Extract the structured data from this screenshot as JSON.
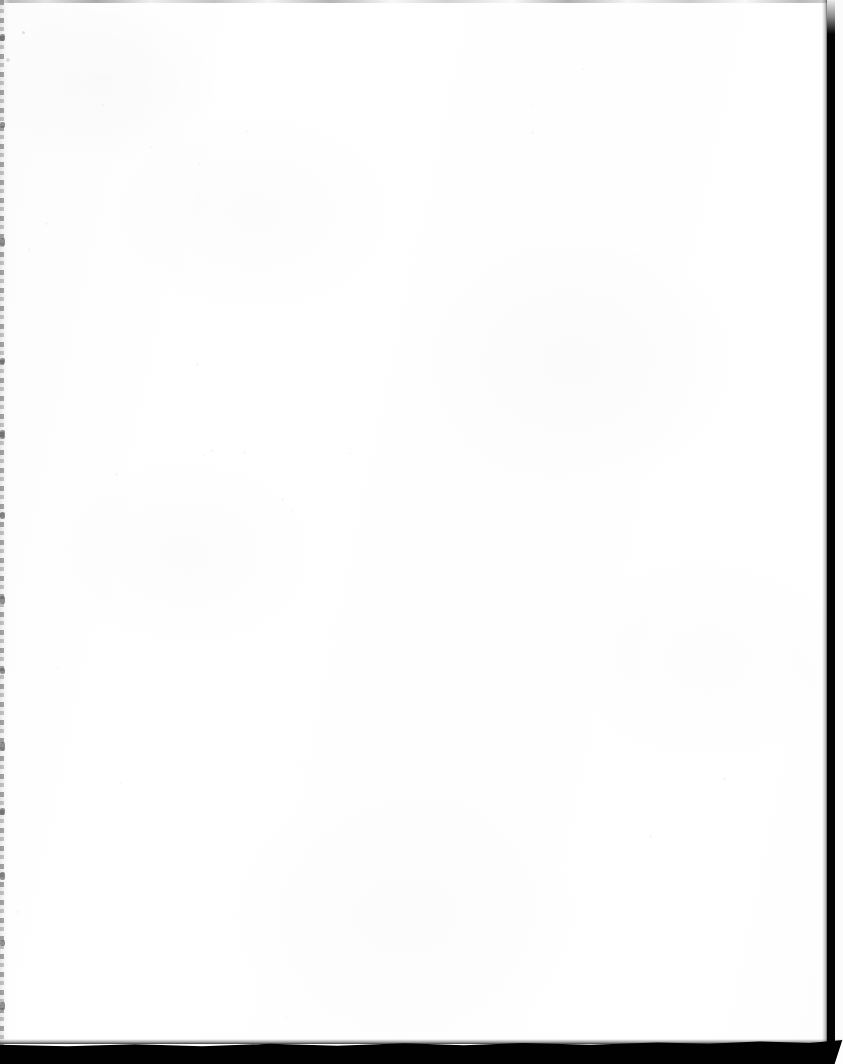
{
  "document": {
    "kind": "scanned-page",
    "page_state": "blank",
    "visible_text": "",
    "page_width_px": 843,
    "page_height_px": 1064
  },
  "page": {
    "body_text": "",
    "header_text": "",
    "footer_text": "",
    "page_number": "",
    "caption": ""
  },
  "colors": {
    "paper": "#fefefe",
    "paper_edge": "#fcfcfc",
    "scan_band_black": "#010101",
    "gutter_gray": "#6c6c70",
    "hairline_gray": "#84848a",
    "notch_white": "#fdfdfd"
  },
  "artifacts": {
    "top_hairline": {
      "name": "top-edge-hairline",
      "description": "",
      "y_px": 0,
      "height_px": 3,
      "color": "#84848a"
    },
    "left_gutter": {
      "name": "left-binding-gutter",
      "description": "",
      "x_px": 0,
      "width_px": 4,
      "color": "#6c6c70"
    },
    "right_band": {
      "name": "right-scanner-band",
      "description": "",
      "x_px": 827,
      "width_px": 8,
      "color": "#020202"
    },
    "bottom_band": {
      "name": "bottom-scanner-band",
      "description": "",
      "y_px": 1040,
      "height_px": 24,
      "color": "#010101"
    }
  },
  "gutter_blobs": [
    {
      "top": 34,
      "height": 7
    },
    {
      "top": 122,
      "height": 6
    },
    {
      "top": 238,
      "height": 8
    },
    {
      "top": 358,
      "height": 6
    },
    {
      "top": 430,
      "height": 9
    },
    {
      "top": 512,
      "height": 7
    },
    {
      "top": 596,
      "height": 8
    },
    {
      "top": 668,
      "height": 6
    },
    {
      "top": 742,
      "height": 9
    },
    {
      "top": 808,
      "height": 7
    },
    {
      "top": 872,
      "height": 8
    },
    {
      "top": 940,
      "height": 6
    },
    {
      "top": 1002,
      "height": 8
    }
  ],
  "specks": [
    {
      "left": 22,
      "top": 31,
      "size": 3,
      "tone": "dark"
    },
    {
      "left": 6,
      "top": 58,
      "size": 4,
      "tone": "dark"
    },
    {
      "left": 196,
      "top": 363,
      "size": 3,
      "tone": "faint"
    },
    {
      "left": 210,
      "top": 449,
      "size": 3,
      "tone": "faint"
    },
    {
      "left": 203,
      "top": 454,
      "size": 2,
      "tone": "faint"
    },
    {
      "left": 243,
      "top": 451,
      "size": 3,
      "tone": "faint"
    },
    {
      "left": 349,
      "top": 452,
      "size": 2,
      "tone": "faint"
    },
    {
      "left": 115,
      "top": 473,
      "size": 3,
      "tone": "faint"
    },
    {
      "left": 281,
      "top": 498,
      "size": 3,
      "tone": "faint"
    },
    {
      "left": 292,
      "top": 510,
      "size": 2,
      "tone": "faint"
    },
    {
      "left": 723,
      "top": 777,
      "size": 3,
      "tone": "faint"
    },
    {
      "left": 649,
      "top": 835,
      "size": 3,
      "tone": "faint"
    },
    {
      "left": 102,
      "top": 104,
      "size": 2,
      "tone": "faint"
    },
    {
      "left": 245,
      "top": 130,
      "size": 3,
      "tone": "faint"
    },
    {
      "left": 530,
      "top": 105,
      "size": 2,
      "tone": "faint"
    },
    {
      "left": 531,
      "top": 131,
      "size": 3,
      "tone": "faint"
    },
    {
      "left": 150,
      "top": 146,
      "size": 2,
      "tone": "faint"
    },
    {
      "left": 198,
      "top": 163,
      "size": 2,
      "tone": "faint"
    },
    {
      "left": 45,
      "top": 222,
      "size": 3,
      "tone": "faint"
    },
    {
      "left": 197,
      "top": 196,
      "size": 2,
      "tone": "faint"
    },
    {
      "left": 582,
      "top": 68,
      "size": 2,
      "tone": "faint"
    },
    {
      "left": 28,
      "top": 248,
      "size": 3,
      "tone": "faint"
    },
    {
      "left": 16,
      "top": 910,
      "size": 3,
      "tone": "faint"
    },
    {
      "left": 120,
      "top": 782,
      "size": 2,
      "tone": "faint"
    },
    {
      "left": 57,
      "top": 667,
      "size": 2,
      "tone": "faint"
    },
    {
      "left": 331,
      "top": 631,
      "size": 2,
      "tone": "faint"
    },
    {
      "left": 407,
      "top": 959,
      "size": 2,
      "tone": "faint"
    },
    {
      "left": 285,
      "top": 1016,
      "size": 2,
      "tone": "faint"
    }
  ]
}
